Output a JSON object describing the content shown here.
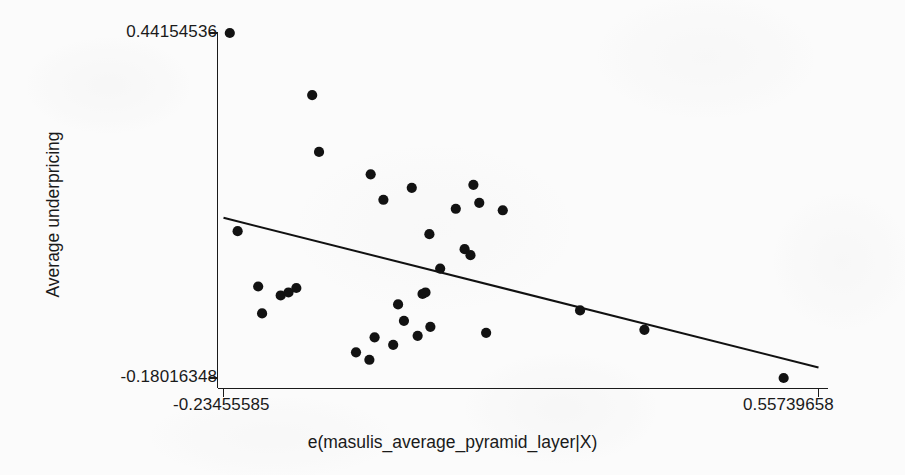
{
  "chart_data": {
    "type": "scatter",
    "title": "",
    "xlabel": "e(masulis_average_pyramid_layer|X)",
    "ylabel": "Average underpricing",
    "xtick_labels": [
      "-0.23455585",
      "0.55739658"
    ],
    "ytick_labels": [
      "-0.18016348",
      "0.44154536"
    ],
    "xlim": [
      -0.23455585,
      0.55739658
    ],
    "ylim": [
      -0.18016348,
      0.44154536
    ],
    "grid": false,
    "legend": null,
    "marker_color": "#121212",
    "line_color": "#111111",
    "axis_color": "#1a1a1a",
    "background_color": "#fbfbfb",
    "series": [
      {
        "name": "Partial residuals",
        "points": [
          [
            -0.22617,
            0.44155
          ],
          [
            -0.11651,
            0.32967
          ],
          [
            -0.10739,
            0.22727
          ],
          [
            -0.03866,
            0.18683
          ],
          [
            -0.02172,
            0.14101
          ],
          [
            0.01605,
            0.16254
          ],
          [
            0.07462,
            0.12479
          ],
          [
            0.09807,
            0.16794
          ],
          [
            0.10588,
            0.13557
          ],
          [
            0.13714,
            0.1221
          ],
          [
            -0.21575,
            0.08435
          ],
          [
            0.03949,
            0.07896
          ],
          [
            0.08635,
            0.05204
          ],
          [
            0.09416,
            0.04126
          ],
          [
            0.05383,
            0.01704
          ],
          [
            -0.1884,
            -0.01527
          ],
          [
            -0.15844,
            -0.03145
          ],
          [
            -0.14803,
            -0.02606
          ],
          [
            -0.13762,
            -0.01797
          ],
          [
            0.03037,
            -0.02875
          ],
          [
            0.03428,
            -0.02606
          ],
          [
            -0.18319,
            -0.06376
          ],
          [
            -0.00219,
            -0.04762
          ],
          [
            0.00562,
            -0.07722
          ],
          [
            0.04079,
            -0.088
          ],
          [
            0.02386,
            -0.10418
          ],
          [
            -0.03345,
            -0.10687
          ],
          [
            -0.0087,
            -0.12036
          ],
          [
            -0.0582,
            -0.13384
          ],
          [
            -0.04039,
            -0.14731
          ],
          [
            0.115,
            -0.09878
          ],
          [
            0.24002,
            -0.05834
          ],
          [
            0.32568,
            -0.09339
          ],
          [
            0.51101,
            -0.18016
          ]
        ]
      }
    ],
    "fit_line": {
      "name": "Linear fit",
      "x_start": -0.23455585,
      "y_start": 0.10857,
      "x_end": 0.55739658,
      "y_end": -0.16129
    }
  }
}
